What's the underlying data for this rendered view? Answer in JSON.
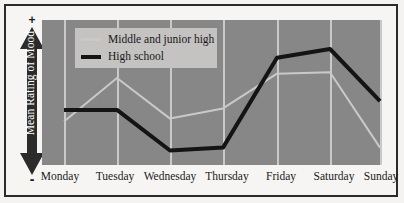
{
  "figure": {
    "background_color": "#f6f5f3",
    "border_color": "#2b2b2b"
  },
  "yaxis": {
    "label": "Mean Rating of Mood",
    "positive_sign": "+",
    "negative_sign": "-",
    "arrow_color": "#2b2b2b",
    "label_color": "#ffffff"
  },
  "legend": {
    "background_color": "#c4c3c1",
    "entries": [
      {
        "label": "Middle and junior high",
        "color": "#c9c9c9",
        "swatch": "line-swatch-thin"
      },
      {
        "label": "High school",
        "color": "#141414",
        "swatch": "line-swatch-thick"
      }
    ]
  },
  "plot": {
    "background_color": "#878787",
    "gridline_color": "#c9c9c9"
  },
  "xaxis": {
    "labels": [
      "Monday",
      "Tuesday",
      "Wednesday",
      "Thursday",
      "Friday",
      "Saturday",
      "Sunday"
    ]
  },
  "chart_data": {
    "type": "line",
    "title": "",
    "subtitle": "",
    "xlabel": "",
    "ylabel": "Mean Rating of Mood",
    "categories": [
      "Monday",
      "Tuesday",
      "Wednesday",
      "Thursday",
      "Friday",
      "Saturday",
      "Sunday"
    ],
    "ylim": [
      0,
      100
    ],
    "yaxis_ticks": [
      "-",
      "+"
    ],
    "yaxis_tick_note": "Unlabeled ordinal axis: low (-) at bottom, high (+) at top",
    "grid": "vertical-only",
    "legend_position": "upper-left-inside",
    "series": [
      {
        "name": "Middle and junior high",
        "color": "#c9c9c9",
        "width": 2,
        "values": [
          30,
          60,
          32,
          39,
          63,
          64,
          12
        ]
      },
      {
        "name": "High school",
        "color": "#141414",
        "width": 4,
        "values": [
          38,
          38,
          10,
          12,
          74,
          80,
          44
        ]
      }
    ],
    "annotations": []
  }
}
